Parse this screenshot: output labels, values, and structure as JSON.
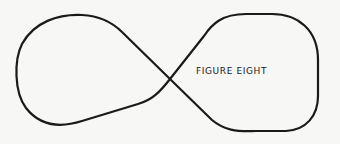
{
  "diagram": {
    "label": "FIGURE EIGHT",
    "stroke_color": "#1a1a1a",
    "background_color": "#f7f7f5",
    "shape": "figure-eight-track"
  }
}
